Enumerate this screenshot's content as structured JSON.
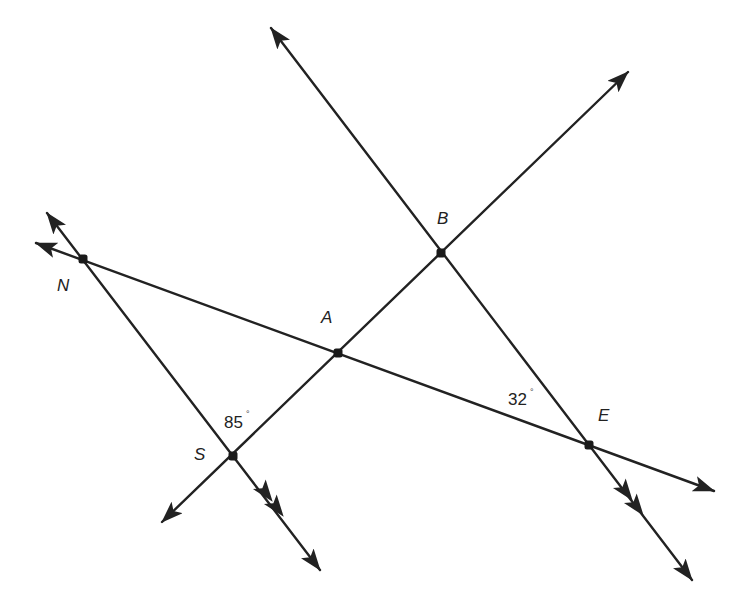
{
  "diagram": {
    "type": "geometry-lines-and-angles",
    "colors": {
      "stroke": "#222222",
      "background": "#ffffff"
    },
    "points": {
      "N": {
        "label": "N",
        "x": 83,
        "y": 259,
        "label_x": 57,
        "label_y": 291
      },
      "A": {
        "label": "A",
        "x": 338,
        "y": 353,
        "label_x": 321,
        "label_y": 323
      },
      "B": {
        "label": "B",
        "x": 441,
        "y": 253,
        "label_x": 437,
        "label_y": 224
      },
      "S": {
        "label": "S",
        "x": 233,
        "y": 456,
        "label_x": 194,
        "label_y": 460
      },
      "E": {
        "label": "E",
        "x": 589,
        "y": 445,
        "label_x": 598,
        "label_y": 421
      }
    },
    "lines": [
      {
        "id": "line-NE",
        "through": [
          "N",
          "A",
          "E"
        ],
        "start": [
          36,
          243
        ],
        "end": [
          714,
          491
        ],
        "arrows": "both",
        "parallel_marks": 0
      },
      {
        "id": "line-SB",
        "through": [
          "S",
          "A",
          "B"
        ],
        "start": [
          162,
          522
        ],
        "end": [
          628,
          72
        ],
        "arrows": "both",
        "parallel_marks": 0
      },
      {
        "id": "line-NS",
        "through": [
          "N",
          "S"
        ],
        "start": [
          47,
          213
        ],
        "end": [
          320,
          570
        ],
        "arrows": "both",
        "parallel_marks": 2
      },
      {
        "id": "line-BE",
        "through": [
          "B",
          "E"
        ],
        "start": [
          271,
          28
        ],
        "end": [
          692,
          580
        ],
        "arrows": "both",
        "parallel_marks": 2
      }
    ],
    "angles": [
      {
        "value": "85",
        "unit": "°",
        "at": "S",
        "text": "85",
        "label_x": 224,
        "label_y": 428
      },
      {
        "value": "32",
        "unit": "°",
        "at": "E",
        "text": "32",
        "label_x": 508,
        "label_y": 405
      }
    ],
    "degree_symbol": "°"
  }
}
